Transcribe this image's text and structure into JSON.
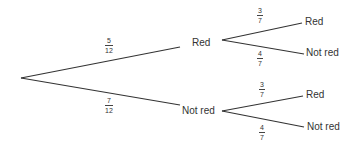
{
  "diagram": {
    "type": "probability-tree",
    "stage1": [
      {
        "label": "Red",
        "prob_num": "5",
        "prob_den": "12"
      },
      {
        "label": "Not red",
        "prob_num": "7",
        "prob_den": "12"
      }
    ],
    "stage2": {
      "red": [
        {
          "label": "Red",
          "prob_num": "3",
          "prob_den": "7"
        },
        {
          "label": "Not red",
          "prob_num": "4",
          "prob_den": "7"
        }
      ],
      "not_red": [
        {
          "label": "Red",
          "prob_num": "3",
          "prob_den": "7"
        },
        {
          "label": "Not red",
          "prob_num": "4",
          "prob_den": "7"
        }
      ]
    },
    "line_color": "#333333"
  }
}
